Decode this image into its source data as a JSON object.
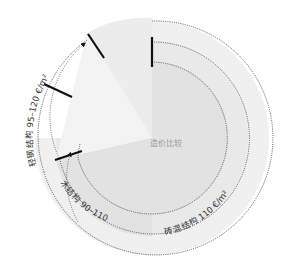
{
  "title": "造价比较",
  "colors": {
    "ring_outer": "#f1f1f1",
    "ring_middle": "#ebebeb",
    "ring_inner": "#e4e4e4",
    "wedge_light": "#f7f7f7",
    "dotted": "#555555",
    "tick": "#111111",
    "text": "#333333"
  },
  "rings": [
    {
      "name": "轻钢结构",
      "label_name": "轻钢结构",
      "label_value": "95–120 €/m²",
      "radius": 117
    },
    {
      "name": "砖混结构",
      "label_name": "砖混结构",
      "label_value": "110 €/m²",
      "radius": 96
    },
    {
      "name": "木结构",
      "label_name": "木结构",
      "label_value": "90–110 €/m²",
      "radius": 76
    }
  ],
  "labels": {
    "steel": "轻钢结构  95–120 €/m²",
    "brick": "砖混结构  110 €/m²",
    "timber": "木结构  90–110 €/m²"
  }
}
